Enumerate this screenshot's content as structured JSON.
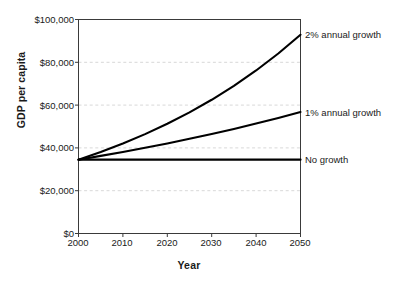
{
  "chart_data": {
    "type": "line",
    "title": "",
    "xlabel": "Year",
    "ylabel": "GDP per capita",
    "xlim": [
      2000,
      2050
    ],
    "ylim": [
      0,
      100000
    ],
    "grid": true,
    "legend_position": "right-inline-annotations",
    "x": [
      2000,
      2005,
      2010,
      2015,
      2020,
      2025,
      2030,
      2035,
      2040,
      2045,
      2050
    ],
    "xticks": [
      "2000",
      "2010",
      "2020",
      "2030",
      "2040",
      "2050"
    ],
    "xtick_values": [
      2000,
      2010,
      2020,
      2030,
      2040,
      2050
    ],
    "yticks": [
      "$0",
      "$20,000",
      "$40,000",
      "$60,000",
      "$80,000",
      "$100,000"
    ],
    "ytick_values": [
      0,
      20000,
      40000,
      60000,
      80000,
      100000
    ],
    "series": [
      {
        "name": "2% annual growth",
        "annotation": "2% annual growth",
        "color": "#000000",
        "values": [
          34500,
          38090,
          42055,
          46432,
          51264,
          56600,
          62491,
          68996,
          76177,
          84105,
          92857
        ]
      },
      {
        "name": "1% annual growth",
        "annotation": "1% annual growth",
        "color": "#000000",
        "values": [
          34500,
          36260,
          38109,
          40052,
          42094,
          44240,
          46495,
          48866,
          51357,
          53976,
          56728
        ]
      },
      {
        "name": "No growth",
        "annotation": "No growth",
        "color": "#000000",
        "values": [
          34500,
          34500,
          34500,
          34500,
          34500,
          34500,
          34500,
          34500,
          34500,
          34500,
          34500
        ]
      }
    ],
    "colors": {
      "axis": "#3a3a3a",
      "grid": "#d8d8d8",
      "line": "#000000",
      "background": "#ffffff"
    }
  }
}
